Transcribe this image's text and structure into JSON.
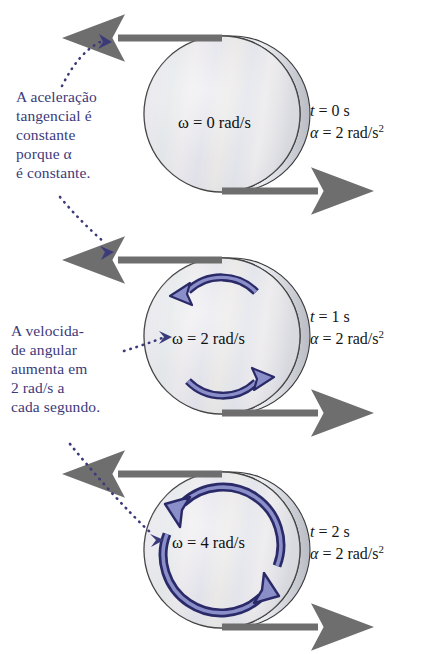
{
  "figure": {
    "language": "pt-BR",
    "colors": {
      "annotation_text": "#3b3a7a",
      "state_text": "#151515",
      "rotation_arrow_stroke": "#2b2a68",
      "rotation_arrow_fill": "#8a8ec9",
      "tangential_arrow": "#6e6e6e",
      "disk_outline": "#3a3a3a",
      "leader_dot": "#3b3a7a",
      "background": "#ffffff"
    }
  },
  "annotations": [
    {
      "id": "tangential-acceleration-note",
      "text": "A aceleração\ntangencial é\nconstante\nporque α\né constante."
    },
    {
      "id": "angular-velocity-note",
      "text": "A velocida-\nde angular\naumenta em\n2 rad/s a\ncada segundo."
    }
  ],
  "panels": [
    {
      "id": "panel-t0",
      "omega_label": "ω = 0 rad/s",
      "omega_value": 0,
      "omega_unit": "rad/s",
      "time_symbol": "t",
      "time_value": "0",
      "time_unit": "s",
      "alpha_symbol": "α",
      "alpha_value": "2",
      "alpha_unit": "rad/s",
      "alpha_exponent": "2",
      "rotation_arrows": 0
    },
    {
      "id": "panel-t1",
      "omega_label": "ω = 2 rad/s",
      "omega_value": 2,
      "omega_unit": "rad/s",
      "time_symbol": "t",
      "time_value": "1",
      "time_unit": "s",
      "alpha_symbol": "α",
      "alpha_value": "2",
      "alpha_unit": "rad/s",
      "alpha_exponent": "2",
      "rotation_arrows": 2
    },
    {
      "id": "panel-t2",
      "omega_label": "ω = 4 rad/s",
      "omega_value": 4,
      "omega_unit": "rad/s",
      "time_symbol": "t",
      "time_value": "2",
      "time_unit": "s",
      "alpha_symbol": "α",
      "alpha_value": "2",
      "alpha_unit": "rad/s",
      "alpha_exponent": "2",
      "rotation_arrows": 2
    }
  ]
}
